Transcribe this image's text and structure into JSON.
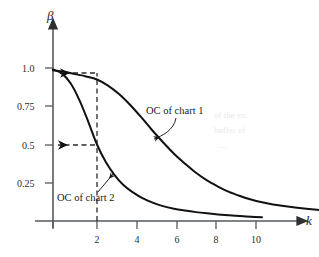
{
  "chart_data": {
    "type": "line",
    "title": "",
    "xlabel": "k",
    "ylabel": "β",
    "xlim": [
      0,
      13.2
    ],
    "ylim": [
      0,
      1.08
    ],
    "grid": false,
    "legend_position": "inline-annotations",
    "x_ticks": [
      2,
      4,
      6,
      8,
      10
    ],
    "x_tick_labels": [
      "2",
      "4",
      "6",
      "8",
      "10"
    ],
    "y_ticks": [
      0.25,
      0.5,
      0.75,
      1.0
    ],
    "y_tick_labels": [
      "0.25",
      "0.5",
      "0.75",
      "1.0"
    ],
    "series": [
      {
        "name": "OC of chart 1",
        "x": [
          0,
          0.5,
          1.0,
          1.5,
          2.0,
          2.5,
          3.0,
          3.5,
          4.0,
          4.5,
          5.0,
          5.5,
          6.0,
          6.5,
          7.0,
          7.5,
          8.0,
          8.5,
          9.0,
          9.5,
          10.0,
          11.0,
          12.0,
          12.8
        ],
        "y": [
          0.985,
          0.975,
          0.96,
          0.945,
          0.925,
          0.885,
          0.83,
          0.76,
          0.68,
          0.595,
          0.515,
          0.44,
          0.375,
          0.315,
          0.265,
          0.225,
          0.19,
          0.163,
          0.14,
          0.122,
          0.108,
          0.088,
          0.073,
          0.066
        ]
      },
      {
        "name": "OC of chart 2",
        "x": [
          0,
          0.4,
          0.8,
          1.2,
          1.6,
          2.0,
          2.4,
          2.8,
          3.2,
          3.6,
          4.0,
          4.5,
          5.0,
          5.5,
          6.0,
          6.5,
          7.0,
          7.5,
          8.0,
          8.5,
          9.0,
          9.5
        ],
        "y": [
          0.99,
          0.965,
          0.9,
          0.79,
          0.65,
          0.5,
          0.385,
          0.3,
          0.235,
          0.19,
          0.155,
          0.122,
          0.097,
          0.08,
          0.068,
          0.058,
          0.05,
          0.043,
          0.037,
          0.032,
          0.028,
          0.025
        ]
      }
    ],
    "annotations": [
      {
        "id": "label-chart1",
        "text": "OC of chart 1",
        "x": 4.7,
        "y": 0.73
      },
      {
        "id": "label-chart2",
        "text": "OC of chart 2",
        "x": 1.1,
        "y": 0.165
      },
      {
        "id": "ghost-watermark",
        "text_lines": [
          "of the ex",
          "buffer of",
          "...."
        ]
      }
    ],
    "guides": [
      {
        "id": "vertical-at-k2",
        "type": "vline",
        "x": 2.0,
        "from_y": 0.0,
        "to_y": 0.925,
        "style": "dashed"
      },
      {
        "id": "horizontal-to-chart1",
        "type": "hline",
        "y": 0.925,
        "from_x": 2.0,
        "to_x": 0.0,
        "style": "dashed",
        "arrow": "left"
      },
      {
        "id": "horizontal-to-chart2",
        "type": "hline",
        "y": 0.5,
        "from_x": 2.0,
        "to_x": 0.0,
        "style": "dashed",
        "arrow": "left"
      }
    ]
  }
}
